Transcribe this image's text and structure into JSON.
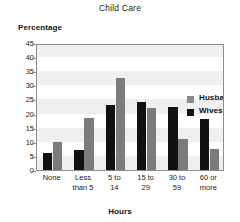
{
  "chart_data": {
    "type": "bar",
    "title": "Child Care",
    "xlabel": "Hours",
    "ylabel": "Percentage",
    "categories": [
      "None",
      "Less than 5",
      "5 to 14",
      "15 to 29",
      "30 to 59",
      "60 or more"
    ],
    "category_lines": [
      [
        "None"
      ],
      [
        "Less",
        "than 5"
      ],
      [
        "5 to",
        "14"
      ],
      [
        "15 to",
        "29"
      ],
      [
        "30 to",
        "59"
      ],
      [
        "60 or",
        "more"
      ]
    ],
    "series": [
      {
        "name": "Wives",
        "color": "#111111",
        "values": [
          6,
          7,
          23,
          24,
          22.5,
          18
        ]
      },
      {
        "name": "Husbands",
        "color": "#7b7b7b",
        "values": [
          10,
          18.5,
          32.5,
          22,
          11,
          7.5
        ]
      }
    ],
    "series_draw_order": [
      "Wives",
      "Husbands"
    ],
    "ylim": [
      0,
      45
    ],
    "yticks": [
      0,
      5,
      10,
      15,
      20,
      25,
      30,
      35,
      40,
      45
    ],
    "ytick_labels": [
      "0",
      "5",
      "10",
      "15",
      "20",
      "25",
      "30",
      "35",
      "40",
      "45"
    ],
    "grid": "alternating horizontal bands",
    "grid_band_color": "#efefef",
    "legend": {
      "position": "top-right inside plot",
      "entries": [
        {
          "label": "Husbands",
          "swatch_color": "#8a8a8a"
        },
        {
          "label": "Wives",
          "swatch_color": "#141414"
        }
      ]
    }
  }
}
